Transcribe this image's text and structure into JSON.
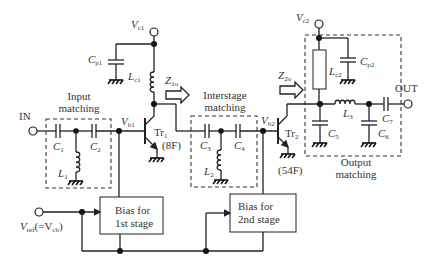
{
  "terminals": {
    "input": "IN",
    "output": "OUT",
    "vc1": {
      "main": "V",
      "sub": "c1"
    },
    "vc2": {
      "main": "V",
      "sub": "c2"
    },
    "vref": {
      "main": "V",
      "sub": "ref",
      "paren_main": "(=V",
      "paren_sub": "cb",
      "paren_close": ")"
    }
  },
  "nodes": {
    "vb1": {
      "main": "V",
      "sub": "b1"
    },
    "vb2": {
      "main": "V",
      "sub": "b2"
    }
  },
  "impedances": {
    "z1o": {
      "main": "Z",
      "sub": "1o"
    },
    "z2o": {
      "main": "Z",
      "sub": "2o"
    }
  },
  "transistors": [
    {
      "main": "Tr",
      "sub": "1",
      "size": "(8F)"
    },
    {
      "main": "Tr",
      "sub": "2",
      "size": "(54F)"
    }
  ],
  "components": {
    "cp1": {
      "main": "C",
      "sub": "p1"
    },
    "lc1": {
      "main": "L",
      "sub": "c1"
    },
    "c1": {
      "main": "C",
      "sub": "1"
    },
    "c2": {
      "main": "C",
      "sub": "2"
    },
    "l1": {
      "main": "L",
      "sub": "1"
    },
    "c3": {
      "main": "C",
      "sub": "3"
    },
    "c4": {
      "main": "C",
      "sub": "4"
    },
    "l2": {
      "main": "L",
      "sub": "2"
    },
    "lc2": {
      "main": "L",
      "sub": "c2"
    },
    "cp2": {
      "main": "C",
      "sub": "p2"
    },
    "l3": {
      "main": "L",
      "sub": "3"
    },
    "c5": {
      "main": "C",
      "sub": "5"
    },
    "c6": {
      "main": "C",
      "sub": "6"
    },
    "c7": {
      "main": "C",
      "sub": "7"
    }
  },
  "blocks": {
    "input_matching": [
      "Input",
      "matching"
    ],
    "interstage_matching": [
      "Interstage",
      "matching"
    ],
    "output_matching": [
      "Output",
      "matching"
    ],
    "bias1": [
      "Bias for",
      "1st stage"
    ],
    "bias2": [
      "Bias for",
      "2nd stage"
    ]
  }
}
